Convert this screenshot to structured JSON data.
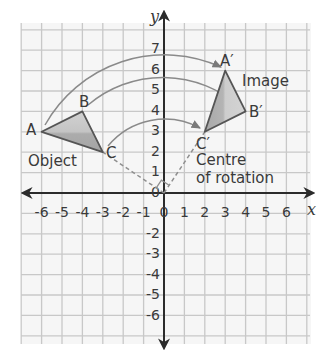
{
  "diagram": {
    "type": "rotation-on-coordinate-grid",
    "axes": {
      "x_label": "x",
      "y_label": "y",
      "x_range": [
        -6,
        6
      ],
      "y_range": [
        -6,
        7
      ],
      "x_ticks": [
        "-6",
        "-5",
        "-4",
        "-3",
        "-2",
        "-1",
        "0",
        "1",
        "2",
        "3",
        "4",
        "5",
        "6"
      ],
      "y_ticks": [
        "7",
        "6",
        "5",
        "4",
        "3",
        "2",
        "1",
        "0",
        "-1",
        "-2",
        "-3",
        "-4",
        "-5",
        "-6"
      ],
      "origin_label": "0"
    },
    "object": {
      "label": "Object",
      "vertices": [
        {
          "name": "A",
          "x": -6,
          "y": 3
        },
        {
          "name": "B",
          "x": -4,
          "y": 4
        },
        {
          "name": "C",
          "x": -3,
          "y": 2
        }
      ]
    },
    "image": {
      "label": "Image",
      "vertices": [
        {
          "name": "A′",
          "x": 3,
          "y": 6
        },
        {
          "name": "B′",
          "x": 4,
          "y": 4
        },
        {
          "name": "C′",
          "x": 2,
          "y": 3
        }
      ]
    },
    "centre": {
      "label_line1": "Centre",
      "label_line2": "of rotation",
      "x": 0,
      "y": 0
    },
    "rotation": "90° clockwise about (0,0)",
    "colors": {
      "grid": "#c8c8c8",
      "axis": "#2b2b2b",
      "arc": "#8a8a8a",
      "triangle_stroke": "#555555",
      "triangle_fill_light": "#cfcfcf",
      "triangle_fill_dark": "#a9a9a9",
      "text": "#3a3a3a"
    }
  }
}
